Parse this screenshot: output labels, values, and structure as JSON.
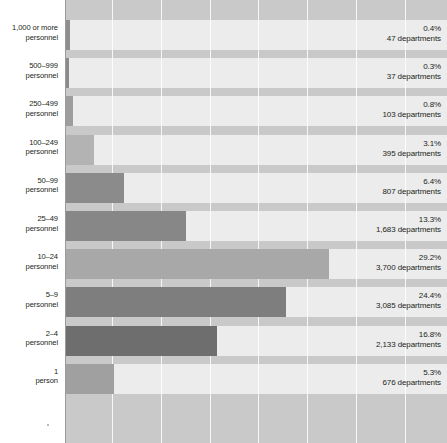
{
  "chart_data": {
    "type": "bar",
    "orientation": "horizontal",
    "title": "",
    "subtitle": "",
    "xlabel": "",
    "ylabel": "",
    "categories": [
      "1,000 or more personnel",
      "500–999 personnel",
      "250–499 personnel",
      "100–249 personnel",
      "50–99 personnel",
      "25–49 personnel",
      "10–24 personnel",
      "5–9 personnel",
      "2–4 personnel",
      "1 person"
    ],
    "values": [
      0.4,
      0.3,
      0.8,
      3.1,
      6.4,
      13.3,
      29.2,
      24.4,
      16.8,
      5.3
    ],
    "counts": [
      47,
      37,
      103,
      395,
      807,
      1683,
      3700,
      3085,
      2133,
      676
    ],
    "value_unit": "%",
    "count_unit": "departments",
    "xlim": [
      0,
      42
    ],
    "grid": true,
    "grid_axis": "x",
    "legend": "none"
  },
  "rows": [
    {
      "label_line1": "1,000 or more",
      "label_line2": "personnel",
      "pct": "0.4%",
      "count": "47 departments",
      "value": 0.4,
      "color": "#8e8e8e"
    },
    {
      "label_line1": "500–999",
      "label_line2": "personnel",
      "pct": "0.3%",
      "count": "37 departments",
      "value": 0.3,
      "color": "#8a8a8a"
    },
    {
      "label_line1": "250–499",
      "label_line2": "personnel",
      "pct": "0.8%",
      "count": "103 departments",
      "value": 0.8,
      "color": "#9d9d9d"
    },
    {
      "label_line1": "100–249",
      "label_line2": "personnel",
      "pct": "3.1%",
      "count": "395 departments",
      "value": 3.1,
      "color": "#b3b3b3"
    },
    {
      "label_line1": "50–99",
      "label_line2": "personnel",
      "pct": "6.4%",
      "count": "807 departments",
      "value": 6.4,
      "color": "#8b8b8b"
    },
    {
      "label_line1": "25–49",
      "label_line2": "personnel",
      "pct": "13.3%",
      "count": "1,683 departments",
      "value": 13.3,
      "color": "#878787"
    },
    {
      "label_line1": "10–24",
      "label_line2": "personnel",
      "pct": "29.2%",
      "count": "3,700 departments",
      "value": 29.2,
      "color": "#a8a8a8"
    },
    {
      "label_line1": "5–9",
      "label_line2": "personnel",
      "pct": "24.4%",
      "count": "3,085 departments",
      "value": 24.4,
      "color": "#7e7e7e"
    },
    {
      "label_line1": "2–4",
      "label_line2": "personnel",
      "pct": "16.8%",
      "count": "2,133 departments",
      "value": 16.8,
      "color": "#6e6e6e"
    },
    {
      "label_line1": "1",
      "label_line2": "person",
      "pct": "5.3%",
      "count": "676 departments",
      "value": 5.3,
      "color": "#a0a0a0"
    }
  ],
  "style": {
    "plot_background": "#c9c9c9",
    "band_background": "#ececec",
    "gridline_color": "#ffffff",
    "text_color": "#231f20",
    "page_background": "#ffffff"
  },
  "geometry": {
    "plot_left": 66,
    "plot_right": 447,
    "px_per_percent": 9.0,
    "gridline_x": [
      112,
      161,
      210,
      258,
      307,
      356,
      405
    ],
    "band_top": 20,
    "band_height": 30,
    "band_pitch": 38.2
  }
}
